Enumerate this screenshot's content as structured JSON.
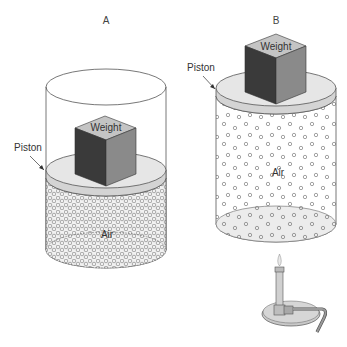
{
  "panels": [
    {
      "id": "A",
      "title": "A",
      "piston_label": "Piston",
      "weight_label": "Weight",
      "gas_label": "Air",
      "gas_state": "compressed"
    },
    {
      "id": "B",
      "title": "B",
      "piston_label": "Piston",
      "weight_label": "Weight",
      "gas_label": "Air",
      "gas_state": "expanded",
      "heat_source": "bunsen-burner"
    }
  ],
  "colors": {
    "cube_dark": "#3a3a3a",
    "cube_mid": "#8a8a8a",
    "cube_top": "#c4c4c4",
    "piston": "#e4e4e4",
    "outline": "#555555"
  }
}
